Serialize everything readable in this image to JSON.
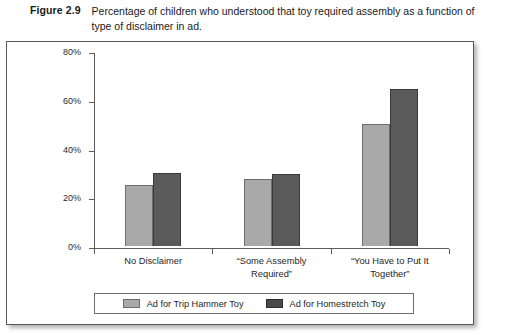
{
  "figure": {
    "number": "Figure 2.9",
    "caption": "Percentage of children who understood that toy required assembly as a function of type of disclaimer in ad."
  },
  "chart_data": {
    "type": "bar",
    "title": "Percentage of children who understood that toy required assembly as a function of type of disclaimer in ad.",
    "xlabel": "",
    "ylabel": "",
    "ylim": [
      0,
      80
    ],
    "yticks": [
      0,
      20,
      40,
      60,
      80
    ],
    "ytick_labels": [
      "0%",
      "20%",
      "40%",
      "60%",
      "80%"
    ],
    "grid": false,
    "legend_position": "bottom",
    "categories": [
      "No Disclaimer",
      "“Some Assembly Required”",
      "“You Have to Put It Together”"
    ],
    "category_lines": [
      [
        "No Disclaimer"
      ],
      [
        "“Some Assembly",
        "Required”"
      ],
      [
        "“You Have to Put It",
        "Together”"
      ]
    ],
    "series": [
      {
        "name": "Ad for Trip Hammer Toy",
        "color": "#a9a9a9",
        "values": [
          25,
          27.5,
          50
        ]
      },
      {
        "name": "Ad for Homestretch Toy",
        "color": "#5b5b5b",
        "values": [
          30,
          29.5,
          64.5
        ]
      }
    ]
  },
  "colors": {
    "series_a": "#a9a9a9",
    "series_b": "#5b5b5b",
    "axis": "#5c5c5c",
    "frame_border": "#55585c",
    "text": "#1f1f1f"
  }
}
